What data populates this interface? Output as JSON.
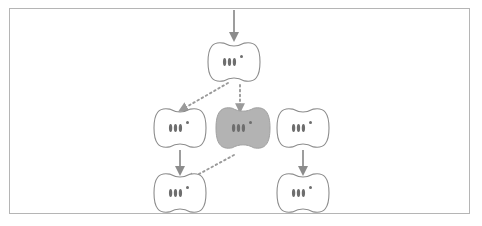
{
  "figure": {
    "kind": "cell-lineage-diagram",
    "title": "",
    "background_color": "#ffffff",
    "frame": {
      "stroke_color": "#b5b5b5",
      "x": 9,
      "y": 8,
      "width": 461,
      "height": 206
    },
    "style": {
      "cell_stroke_color": "#8c8c8c",
      "cell_fill_color": "#ffffff",
      "highlight_fill_color": "#b3b3b3",
      "highlight_stroke_color": "#a0a0a0",
      "organelle_color": "#6e6e6e",
      "nucleolus_color": "#6e6e6e",
      "solid_arrow_color": "#8c8c8c",
      "dotted_arrow_color": "#9a9a9a"
    },
    "cells": [
      {
        "id": "cell-top",
        "label": "",
        "row": "top",
        "column": "center",
        "highlighted": false,
        "cx": 234,
        "cy": 62,
        "rx": 26,
        "ry": 21,
        "organelle_count": 3,
        "has_nucleolus": true
      },
      {
        "id": "cell-middle-left",
        "label": "",
        "row": "middle",
        "column": "left",
        "highlighted": false,
        "cx": 180,
        "cy": 128,
        "rx": 26,
        "ry": 21,
        "organelle_count": 3,
        "has_nucleolus": true
      },
      {
        "id": "cell-middle-center",
        "label": "",
        "row": "middle",
        "column": "center",
        "highlighted": true,
        "cx": 243,
        "cy": 128,
        "rx": 27,
        "ry": 22,
        "organelle_count": 3,
        "has_nucleolus": true
      },
      {
        "id": "cell-middle-right",
        "label": "",
        "row": "middle",
        "column": "right",
        "highlighted": false,
        "cx": 303,
        "cy": 128,
        "rx": 26,
        "ry": 21,
        "organelle_count": 3,
        "has_nucleolus": true
      },
      {
        "id": "cell-bottom-left",
        "label": "",
        "row": "bottom",
        "column": "left",
        "highlighted": false,
        "cx": 180,
        "cy": 193,
        "rx": 26,
        "ry": 21,
        "organelle_count": 3,
        "has_nucleolus": true
      },
      {
        "id": "cell-bottom-right",
        "label": "",
        "row": "bottom",
        "column": "right",
        "highlighted": false,
        "cx": 303,
        "cy": 193,
        "rx": 26,
        "ry": 21,
        "organelle_count": 3,
        "has_nucleolus": true
      }
    ],
    "arrows": [
      {
        "id": "arrow-into-top-cell",
        "style": "solid",
        "label": "",
        "from": [
          234,
          10
        ],
        "to": [
          234,
          39
        ]
      },
      {
        "id": "arrow-middleleft-to-bottomleft",
        "style": "solid",
        "label": "",
        "from": [
          180,
          150
        ],
        "to": [
          180,
          173
        ]
      },
      {
        "id": "arrow-middleright-to-bottomright",
        "style": "solid",
        "label": "",
        "from": [
          303,
          150
        ],
        "to": [
          303,
          173
        ]
      },
      {
        "id": "arrow-top-to-middleleft",
        "style": "dotted",
        "label": "",
        "from": [
          228,
          83
        ],
        "to": [
          181,
          110
        ]
      },
      {
        "id": "arrow-top-to-middlecenter",
        "style": "dotted",
        "label": "",
        "from": [
          240,
          85
        ],
        "to": [
          240,
          110
        ]
      },
      {
        "id": "arrow-middlecenter-to-bottomleft",
        "style": "dotted",
        "label": "",
        "from": [
          234,
          155
        ],
        "to": [
          188,
          180
        ]
      }
    ]
  }
}
